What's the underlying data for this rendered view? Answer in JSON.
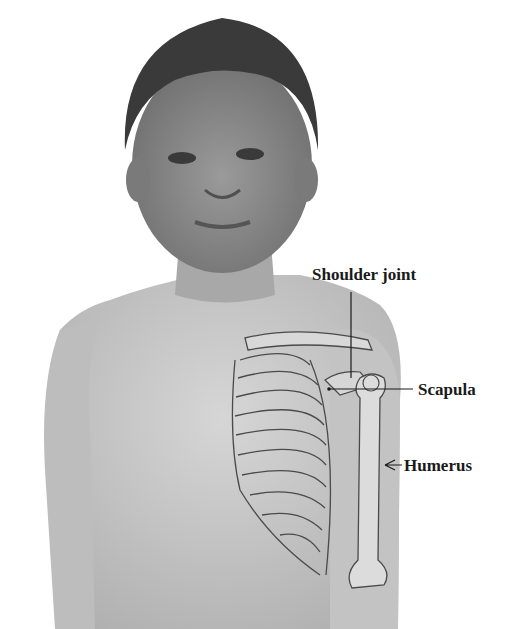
{
  "figure": {
    "colors": {
      "background": "#ffffff",
      "skin": "#c9c9c9",
      "hair": "#3a3a3a",
      "bone_line": "#4a4a4a",
      "label": "#1a1a1a"
    }
  },
  "labels": [
    {
      "id": "shoulder-joint",
      "text": "Shoulder joint"
    },
    {
      "id": "scapula",
      "text": "Scapula"
    },
    {
      "id": "humerus",
      "text": "Humerus"
    }
  ]
}
